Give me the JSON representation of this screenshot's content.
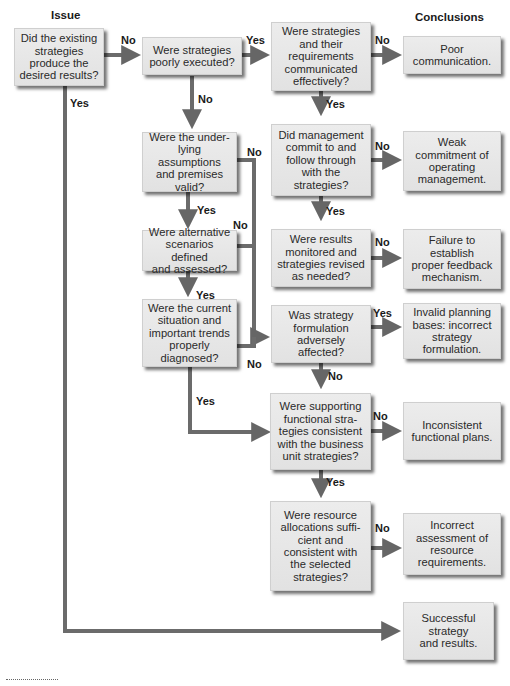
{
  "headings": {
    "issue": "Issue",
    "conclusions": "Conclusions"
  },
  "issues": [
    {
      "id": "q1",
      "text": "Did the existing\nstrategies\nproduce the\ndesired results?"
    },
    {
      "id": "q2",
      "text": "Were strategies\npoorly executed?"
    },
    {
      "id": "q3",
      "text": "Were strategies\nand their\nrequirements\ncommunicated\neffectively?"
    },
    {
      "id": "q4",
      "text": "Did management\ncommit to and\nfollow through\nwith the\nstrategies?"
    },
    {
      "id": "q5",
      "text": "Were results\nmonitored and\nstrategies revised\nas needed?"
    },
    {
      "id": "q6",
      "text": "Were the under-\nlying assumptions\nand premises\nvalid?"
    },
    {
      "id": "q7",
      "text": "Were alternative\nscenarios defined\nand assessed?"
    },
    {
      "id": "q8",
      "text": "Were the current\nsituation and\nimportant trends\nproperly\ndiagnosed?"
    },
    {
      "id": "q9",
      "text": "Was strategy\nformulation\nadversely\naffected?"
    },
    {
      "id": "q10",
      "text": "Were supporting\nfunctional stra-\ntegies consistent\nwith the business\nunit strategies?"
    },
    {
      "id": "q11",
      "text": "Were resource\nallocations suffi-\ncient and\nconsistent with\nthe selected\nstrategies?"
    }
  ],
  "conclusions": [
    {
      "id": "c1",
      "text": "Poor\ncommunication."
    },
    {
      "id": "c2",
      "text": "Weak\ncommitment of\noperating\nmanagement."
    },
    {
      "id": "c3",
      "text": "Failure to\nestablish\nproper feedback\nmechanism."
    },
    {
      "id": "c4",
      "text": "Invalid planning\nbases: incorrect\nstrategy\nformulation."
    },
    {
      "id": "c5",
      "text": "Inconsistent\nfunctional plans."
    },
    {
      "id": "c6",
      "text": "Incorrect\nassessment of\nresource\nrequirements."
    },
    {
      "id": "c7",
      "text": "Successful\nstrategy\nand results."
    }
  ],
  "edge_labels": {
    "q1_no": "No",
    "q1_yes": "Yes",
    "q2_yes": "Yes",
    "q2_no": "No",
    "q3_no": "No",
    "q3_yes": "Yes",
    "q4_no": "No",
    "q4_yes": "Yes",
    "q5_no": "No",
    "q6_no": "No",
    "q6_yes": "Yes",
    "q7_no": "No",
    "q7_yes": "Yes",
    "q8_no": "No",
    "q8_yes": "Yes",
    "q9_yes": "Yes",
    "q9_no": "No",
    "q10_no": "No",
    "q10_yes": "Yes",
    "q11_no": "No"
  },
  "colors": {
    "connector": "#6b6b6b",
    "box_fill": "#e6e6e6",
    "box_shadow": "#555555"
  }
}
